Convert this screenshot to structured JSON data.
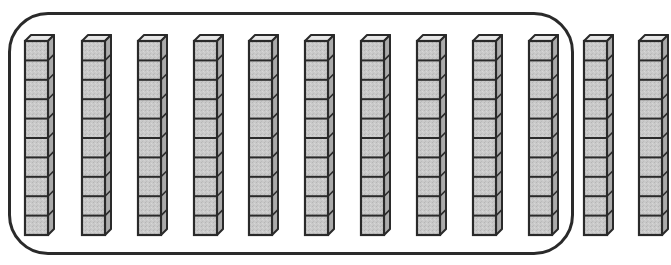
{
  "diagram": {
    "description": "Base-ten blocks: 12 ten-rods, 10 of them grouped inside a rounded rectangle",
    "rods_total": 12,
    "cubes_per_rod": 10,
    "grouped_rod_count": 10,
    "ungrouped_rod_count": 2,
    "grouped_value": 100,
    "total_value": 120,
    "colors": {
      "front_face": "#c9c9c9",
      "side_face": "#ababab",
      "top_face": "#e6e6e6",
      "outline": "#2a2a2a",
      "group_border": "#2a2a2a",
      "background": "#ffffff"
    },
    "rods": [
      {
        "index": 1,
        "x": 24,
        "grouped": true
      },
      {
        "index": 2,
        "x": 81,
        "grouped": true
      },
      {
        "index": 3,
        "x": 137,
        "grouped": true
      },
      {
        "index": 4,
        "x": 193,
        "grouped": true
      },
      {
        "index": 5,
        "x": 248,
        "grouped": true
      },
      {
        "index": 6,
        "x": 304,
        "grouped": true
      },
      {
        "index": 7,
        "x": 360,
        "grouped": true
      },
      {
        "index": 8,
        "x": 416,
        "grouped": true
      },
      {
        "index": 9,
        "x": 472,
        "grouped": true
      },
      {
        "index": 10,
        "x": 528,
        "grouped": true
      },
      {
        "index": 11,
        "x": 583,
        "grouped": false
      },
      {
        "index": 12,
        "x": 638,
        "grouped": false
      }
    ]
  }
}
